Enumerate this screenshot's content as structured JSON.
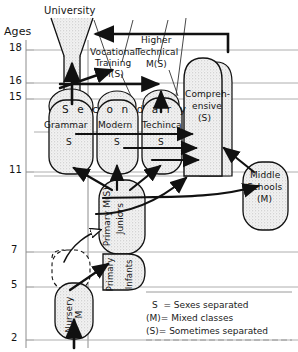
{
  "diagram": {
    "axis": {
      "label": "Ages",
      "ticks": [
        {
          "value": "18",
          "age": 18,
          "y": 50
        },
        {
          "value": "16",
          "age": 16,
          "y": 83
        },
        {
          "value": "15",
          "age": 15,
          "y": 99
        },
        {
          "value": "11",
          "age": 11,
          "y": 172
        },
        {
          "value": "7",
          "age": 7,
          "y": 252
        },
        {
          "value": "5",
          "age": 5,
          "y": 287
        },
        {
          "value": "2",
          "age": 2,
          "y": 340
        }
      ]
    },
    "banner_word": "S e c o n d a r y",
    "nodes": {
      "university": {
        "label": "University"
      },
      "vocational": {
        "line1": "Vocational",
        "line2": "Training",
        "line3": "M(S)"
      },
      "higher_technical": {
        "line1": "Higher",
        "line2": "Technical",
        "line3": "M(S)"
      },
      "comprehensive": {
        "line1": "Compreh-",
        "line2": "ensive",
        "line3": "(S)"
      },
      "middle_schools": {
        "line1": "Middle",
        "line2": "Schools",
        "line3": "(M)"
      },
      "grammar": {
        "line1": "Grammar",
        "line2": "S"
      },
      "modern": {
        "line1": "Modern",
        "line2": "S"
      },
      "technical": {
        "line1": "Techinca",
        "line2": "S"
      },
      "primary_juniors": {
        "line1": "Primary M(S)",
        "line2": "Juniors"
      },
      "primary_infants": {
        "line1": "Primary",
        "line2": "Infants"
      },
      "nursery": {
        "line1": "Nursery",
        "line2": "M"
      }
    },
    "legend": {
      "lines": [
        "S  = Sexes separated",
        "(M)= Mixed classes",
        "(S)= Sometimes separated"
      ]
    },
    "colors": {
      "ink": "#141414",
      "gridline": "#9a9a9a",
      "fill_stipple": "#ebebeb",
      "background": "#ffffff"
    }
  }
}
